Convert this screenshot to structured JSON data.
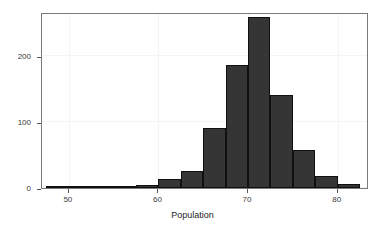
{
  "chart_data": {
    "type": "bar",
    "title": "",
    "subtitle": "",
    "xlabel": "Population",
    "ylabel": "",
    "xlim": [
      47.0,
      83.5
    ],
    "ylim": [
      0,
      267
    ],
    "grid": true,
    "legend": null,
    "bin_width": 2.5,
    "categories": [
      "47.5-50",
      "50-52.5",
      "52.5-55",
      "55-57.5",
      "57.5-60",
      "60-62.5",
      "62.5-65",
      "65-67.5",
      "67.5-70",
      "70-72.5",
      "72.5-75",
      "75-77.5",
      "77.5-80",
      "80-82.5"
    ],
    "bin_starts": [
      47.5,
      50.0,
      52.5,
      55.0,
      57.5,
      60.0,
      62.5,
      65.0,
      67.5,
      70.0,
      72.5,
      75.0,
      77.5,
      80.0
    ],
    "bin_ends": [
      50.0,
      52.5,
      55.0,
      57.5,
      60.0,
      62.5,
      65.0,
      67.5,
      70.0,
      72.5,
      75.0,
      77.5,
      80.0,
      82.5
    ],
    "values": [
      2,
      0,
      2,
      0,
      5,
      14,
      26,
      91,
      187,
      259,
      141,
      57,
      18,
      6
    ],
    "xticks": [
      50,
      60,
      70,
      80
    ],
    "xtick_labels": [
      "50",
      "60",
      "70",
      "80"
    ],
    "yticks": [
      0,
      100,
      200
    ],
    "ytick_labels": [
      "0",
      "100",
      "200"
    ],
    "colors": {
      "bar_fill": "#353535",
      "bar_border": "#101010",
      "panel_border": "#7a7a7a",
      "gridline": "#f4f4f4",
      "tick": "#555555",
      "text": "#3a3a3a",
      "background": "#ffffff"
    }
  }
}
